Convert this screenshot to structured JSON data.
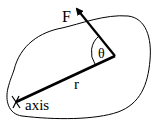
{
  "diagram": {
    "labels": {
      "force": "F",
      "angle": "θ",
      "radius": "r",
      "axis": "axis"
    },
    "colors": {
      "stroke": "#000000",
      "background": "#ffffff"
    },
    "elements": [
      {
        "name": "body-outline",
        "type": "closed-curve"
      },
      {
        "name": "force-vector",
        "type": "arrow",
        "label": "F"
      },
      {
        "name": "radius-line",
        "type": "line",
        "label": "r"
      },
      {
        "name": "angle-arc",
        "type": "arc",
        "label": "θ"
      },
      {
        "name": "axis-marker",
        "type": "x-mark",
        "label": "axis"
      }
    ]
  }
}
